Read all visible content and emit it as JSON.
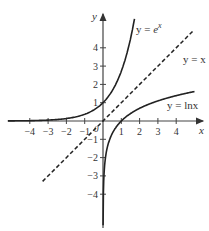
{
  "chart_data": {
    "type": "line",
    "title": "",
    "xlabel": "x",
    "ylabel": "y",
    "xlim": [
      -5,
      5
    ],
    "ylim": [
      -5,
      5
    ],
    "grid": false,
    "x_ticks": [
      -4,
      -3,
      -2,
      -1,
      1,
      2,
      3,
      4
    ],
    "y_ticks": [
      -4,
      -3,
      -2,
      -1,
      1,
      2,
      3,
      4
    ],
    "origin_label": "0",
    "series": [
      {
        "name": "y = e^x",
        "label": "y = e",
        "label_sup": "x",
        "style": "solid",
        "x": [
          -5,
          -4,
          -3,
          -2,
          -1,
          0,
          0.5,
          1,
          1.5,
          1.7
        ],
        "values": [
          0.007,
          0.018,
          0.05,
          0.135,
          0.368,
          1,
          1.65,
          2.72,
          4.48,
          5.47
        ]
      },
      {
        "name": "y = x",
        "label": "y = x",
        "style": "dashed",
        "x": [
          -3.3,
          5
        ],
        "values": [
          -3.3,
          5
        ]
      },
      {
        "name": "y = ln x",
        "label": "y = lnx",
        "style": "solid",
        "x": [
          0.0067,
          0.02,
          0.05,
          0.1,
          0.25,
          0.5,
          1,
          2,
          3,
          4,
          5
        ],
        "values": [
          -5,
          -3.9,
          -3,
          -2.3,
          -1.39,
          -0.69,
          0,
          0.69,
          1.1,
          1.39,
          1.61
        ]
      }
    ]
  }
}
